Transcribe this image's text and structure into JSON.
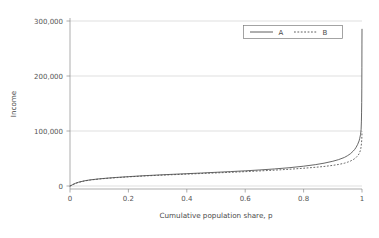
{
  "chart_data": {
    "type": "line",
    "title": "",
    "xlabel": "Cumulative population share, p",
    "ylabel": "Income",
    "xlim": [
      0,
      1
    ],
    "ylim": [
      0,
      300000
    ],
    "grid": true,
    "grid_axis": "y",
    "legend_position": "top-right",
    "xticks": [
      0,
      0.2,
      0.4,
      0.6,
      0.8,
      1
    ],
    "xtick_labels": [
      "0",
      "0.2",
      "0.4",
      "0.6",
      "0.8",
      "1"
    ],
    "yticks": [
      0,
      100000,
      200000,
      300000
    ],
    "ytick_labels": [
      "0",
      "100,000",
      "200,000",
      "300,000"
    ],
    "x": [
      0,
      0.005,
      0.01,
      0.02,
      0.03,
      0.05,
      0.07,
      0.1,
      0.13,
      0.16,
      0.2,
      0.25,
      0.3,
      0.35,
      0.4,
      0.45,
      0.5,
      0.55,
      0.6,
      0.65,
      0.7,
      0.75,
      0.8,
      0.84,
      0.87,
      0.9,
      0.92,
      0.94,
      0.95,
      0.96,
      0.97,
      0.975,
      0.98,
      0.985,
      0.99,
      0.992,
      0.994,
      0.995,
      0.996,
      0.997,
      0.998,
      0.9985,
      0.999,
      0.9993,
      0.9996,
      0.9998,
      1
    ],
    "series": [
      {
        "name": "A",
        "style": "solid",
        "color": "#4d4d4d",
        "values": [
          0,
          1200,
          2800,
          5200,
          7000,
          9500,
          11200,
          13000,
          14400,
          15600,
          17000,
          18600,
          20000,
          21200,
          22400,
          23600,
          24900,
          26200,
          27600,
          29200,
          31000,
          33200,
          36000,
          38800,
          41500,
          45000,
          48000,
          52000,
          55000,
          58500,
          63500,
          66500,
          70500,
          75500,
          82000,
          86000,
          91000,
          94000,
          98000,
          103000,
          118000,
          133000,
          152000,
          178000,
          215000,
          258000,
          285000
        ]
      },
      {
        "name": "B",
        "style": "dashed",
        "color": "#4d4d4d",
        "values": [
          0,
          1100,
          2600,
          4900,
          6700,
          9200,
          10900,
          12700,
          14100,
          15200,
          16600,
          18100,
          19400,
          20500,
          21600,
          22700,
          23800,
          24900,
          26100,
          27400,
          28800,
          30400,
          32300,
          34000,
          35500,
          37500,
          39200,
          41500,
          43200,
          45200,
          48000,
          49800,
          52000,
          54800,
          58500,
          61000,
          64000,
          66000,
          68500,
          71500,
          76500,
          79500,
          83000,
          86500,
          91000,
          96000,
          99000
        ]
      }
    ]
  },
  "legend": {
    "items": [
      {
        "label": "A"
      },
      {
        "label": "B"
      }
    ]
  },
  "colors": {
    "series": "#4d4d4d",
    "grid": "#c9c9c9",
    "axis": "#8a8a8a",
    "text": "#4a4a4a",
    "background": "#ffffff"
  }
}
